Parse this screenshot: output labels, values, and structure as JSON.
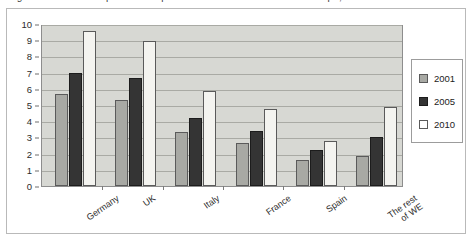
{
  "caption": {
    "text": "Figure 1. Broadband penetration per 100 inhabitants in Western Europe, 2001-2010"
  },
  "chart_data": {
    "type": "bar",
    "title": "",
    "xlabel": "",
    "ylabel": "",
    "ylim": [
      0,
      10
    ],
    "y_ticks": [
      "0",
      "1",
      "2",
      "3",
      "4",
      "5",
      "6",
      "7",
      "8",
      "9",
      "10"
    ],
    "grid": true,
    "legend_position": "right",
    "categories": [
      "Germany",
      "UK",
      "Italy",
      "France",
      "Spain",
      "The rest\nof WE"
    ],
    "series": [
      {
        "name": "2001",
        "color": "#a8a9a4",
        "values": [
          5.65,
          5.3,
          3.35,
          2.65,
          1.6,
          1.85
        ]
      },
      {
        "name": "2005",
        "color": "#343434",
        "values": [
          7.0,
          6.65,
          4.2,
          3.4,
          2.2,
          3.05
        ]
      },
      {
        "name": "2010",
        "color": "#f4f4f0",
        "values": [
          9.55,
          8.95,
          5.85,
          4.75,
          2.75,
          4.85
        ]
      }
    ]
  },
  "legend": {
    "entries": [
      {
        "label": "2001"
      },
      {
        "label": "2005"
      },
      {
        "label": "2010"
      }
    ]
  }
}
